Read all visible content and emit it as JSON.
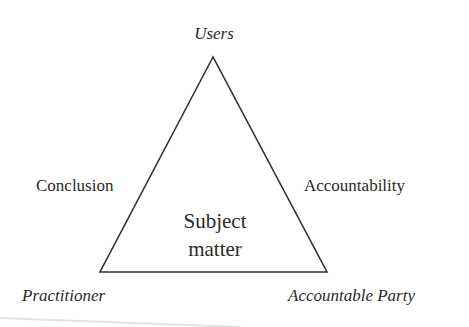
{
  "diagram": {
    "title": "",
    "shape": "triangle",
    "stroke_color": "#333333",
    "text_color": "#2a2a2a",
    "background": "#ffffff",
    "triangle_points": {
      "apex": [
        213,
        57
      ],
      "bottom_left": [
        100,
        272
      ],
      "bottom_right": [
        327,
        272
      ]
    },
    "vertices": {
      "top": "Users",
      "bottom_left": "Practitioner",
      "bottom_right": "Accountable Party"
    },
    "edges": {
      "left": "Conclusion",
      "right": "Accountability"
    },
    "center": {
      "line1": "Subject",
      "line2": "matter"
    }
  }
}
